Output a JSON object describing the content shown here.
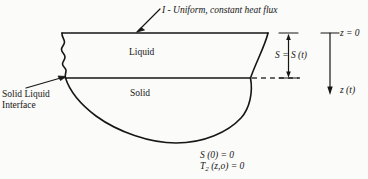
{
  "figure": {
    "name": "melt-pool-heat-flux-diagram",
    "background_color": "#fbfbf9",
    "ink_color": "#161616"
  },
  "labels": {
    "heat_flux": "I - Uniform, constant heat flux",
    "liquid": "Liquid",
    "solid": "Solid",
    "interface_line1": "Solid Liquid",
    "interface_line2": "Interface",
    "s_dimension": "S = S (t)",
    "z_zero": "z = 0",
    "z_of_t": "z (t)"
  },
  "conditions": {
    "initial_depth": "S (0) = 0",
    "initial_temperature_prefix": "T",
    "initial_temperature_subscript": "2",
    "initial_temperature_suffix": " (z,o) = 0"
  },
  "geometry": {
    "top_surface_y": 33,
    "interface_y": 78,
    "pool_left_x": 62,
    "pool_right_x": 268,
    "pool_bottom_y": 143,
    "z_axis_x": 330
  }
}
